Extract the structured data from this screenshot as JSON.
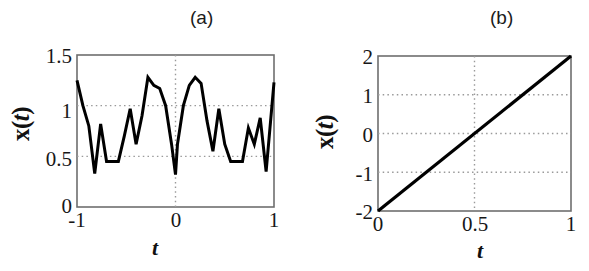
{
  "figure": {
    "background": "#ffffff",
    "ink_color": "#000000",
    "grid_color": "#9a9a9a",
    "axis_color": "#6e6e6e"
  },
  "panels": [
    {
      "id": "a",
      "label": "(a)",
      "xlabel": "t",
      "ylabel_x": "x",
      "ylabel_paren_open": "(",
      "ylabel_t": "t",
      "ylabel_paren_close": ")",
      "yticks": [
        "1.5",
        "1",
        "0.5",
        "0"
      ],
      "xticks": [
        "-1",
        "0",
        "1"
      ]
    },
    {
      "id": "b",
      "label": "(b)",
      "xlabel": "t",
      "ylabel_x": "x",
      "ylabel_paren_open": "(",
      "ylabel_t": "t",
      "ylabel_paren_close": ")",
      "yticks": [
        "2",
        "1",
        "0",
        "-1",
        "-2"
      ],
      "xticks": [
        "0",
        "0.5",
        "1"
      ]
    }
  ],
  "chart_data": [
    {
      "type": "line",
      "panel": "a",
      "title": "(a)",
      "xlabel": "t",
      "ylabel": "x(t)",
      "xlim": [
        -1,
        1
      ],
      "ylim": [
        0,
        1.5
      ],
      "xticks": [
        -1,
        0,
        1
      ],
      "yticks": [
        0,
        0.5,
        1,
        1.5
      ],
      "grid": true,
      "grid_style": "dotted",
      "legend": "none",
      "series": [
        {
          "name": "x(t)",
          "color": "#000000",
          "x": [
            -1.0,
            -0.94,
            -0.88,
            -0.82,
            -0.76,
            -0.7,
            -0.64,
            -0.58,
            -0.52,
            -0.46,
            -0.4,
            -0.34,
            -0.28,
            -0.22,
            -0.16,
            -0.1,
            -0.04,
            0.0,
            0.02,
            0.08,
            0.14,
            0.2,
            0.26,
            0.32,
            0.38,
            0.44,
            0.5,
            0.56,
            0.62,
            0.68,
            0.74,
            0.8,
            0.86,
            0.92,
            1.0
          ],
          "y": [
            1.25,
            1.0,
            0.8,
            0.33,
            0.82,
            0.45,
            0.45,
            0.45,
            0.7,
            0.97,
            0.62,
            0.9,
            1.28,
            1.2,
            1.17,
            1.0,
            0.62,
            0.32,
            0.62,
            1.0,
            1.2,
            1.28,
            1.22,
            0.85,
            0.55,
            0.97,
            0.62,
            0.45,
            0.45,
            0.45,
            0.78,
            0.62,
            0.88,
            0.35,
            1.23
          ]
        }
      ]
    },
    {
      "type": "line",
      "panel": "b",
      "title": "(b)",
      "xlabel": "t",
      "ylabel": "x(t)",
      "xlim": [
        0,
        1
      ],
      "ylim": [
        -2,
        2
      ],
      "xticks": [
        0,
        0.5,
        1
      ],
      "yticks": [
        -2,
        -1,
        0,
        1,
        2
      ],
      "grid": true,
      "grid_style": "dotted",
      "legend": "none",
      "series": [
        {
          "name": "x(t)",
          "color": "#000000",
          "x": [
            0,
            1
          ],
          "y": [
            -2,
            2
          ]
        }
      ]
    }
  ]
}
